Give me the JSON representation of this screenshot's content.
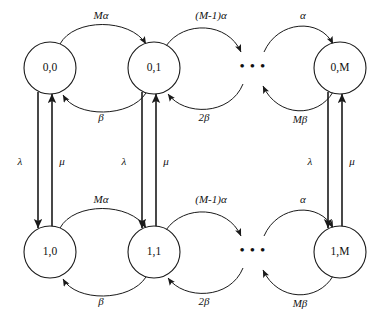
{
  "figure": {
    "kind": "markov-state-transition-diagram",
    "background_color": "#ffffff",
    "stroke_color": "#1a1a1a",
    "text_color": "#111111"
  },
  "states": {
    "top_row": [
      {
        "id": "s00",
        "label": "0,0",
        "cx": 50,
        "cy": 68,
        "r": 26
      },
      {
        "id": "s01",
        "label": "0,1",
        "cx": 154,
        "cy": 68,
        "r": 26
      },
      {
        "id": "s0M",
        "label": "0,M",
        "cx": 340,
        "cy": 68,
        "r": 26
      }
    ],
    "bottom_row": [
      {
        "id": "s10",
        "label": "1,0",
        "cx": 50,
        "cy": 252,
        "r": 26
      },
      {
        "id": "s11",
        "label": "1,1",
        "cx": 154,
        "cy": 252,
        "r": 26
      },
      {
        "id": "s1M",
        "label": "1,M",
        "cx": 340,
        "cy": 252,
        "r": 26
      }
    ]
  },
  "ellipsis": {
    "glyph": "• • •",
    "top": {
      "x": 253,
      "y": 68
    },
    "bottom": {
      "x": 253,
      "y": 252
    }
  },
  "horizontal_rates": {
    "top_forward": [
      {
        "label": "Mα",
        "x": 101,
        "y": 16
      },
      {
        "label": "(M-1)α",
        "x": 211,
        "y": 16
      },
      {
        "label": "α",
        "x": 303,
        "y": 16
      }
    ],
    "top_backward": [
      {
        "label": "β",
        "x": 101,
        "y": 118
      },
      {
        "label": "2β",
        "x": 204,
        "y": 118
      },
      {
        "label": "Mβ",
        "x": 300,
        "y": 120
      }
    ],
    "bottom_forward": [
      {
        "label": "Mα",
        "x": 101,
        "y": 200
      },
      {
        "label": "(M-1)α",
        "x": 211,
        "y": 200
      },
      {
        "label": "α",
        "x": 303,
        "y": 200
      }
    ],
    "bottom_backward": [
      {
        "label": "β",
        "x": 101,
        "y": 302
      },
      {
        "label": "2β",
        "x": 204,
        "y": 302
      },
      {
        "label": "Mβ",
        "x": 300,
        "y": 304
      }
    ]
  },
  "vertical_rates": {
    "down_lambda": [
      {
        "label": "λ",
        "x": 20,
        "y": 162
      },
      {
        "label": "λ",
        "x": 124,
        "y": 162
      },
      {
        "label": "λ",
        "x": 310,
        "y": 162
      }
    ],
    "up_mu": [
      {
        "label": "μ",
        "x": 62,
        "y": 162
      },
      {
        "label": "μ",
        "x": 166,
        "y": 162
      },
      {
        "label": "μ",
        "x": 352,
        "y": 162
      }
    ]
  },
  "legend_meaning": {
    "alpha": "arrival / activation rate per idle source",
    "beta": "service completion rate per busy unit",
    "lambda": "transition rate from row 0 to row 1",
    "mu": "transition rate from row 1 to row 0"
  }
}
